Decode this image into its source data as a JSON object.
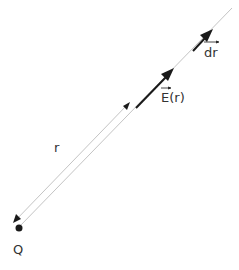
{
  "diagram": {
    "charge_label": "Q",
    "distance_label": "r",
    "field_label": "E(r)",
    "displacement_label": "dr",
    "colors": {
      "line": "#bdbdbd",
      "arrow": "#1a1a1a",
      "text": "#333333"
    }
  }
}
